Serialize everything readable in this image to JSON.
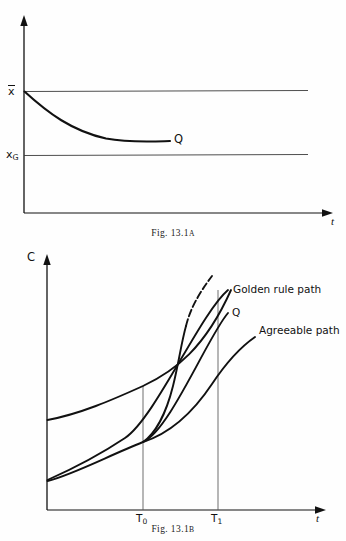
{
  "document": {
    "type": "textbook-figure-page",
    "figure_count": 2
  },
  "figure_a": {
    "caption_prefix": "Fig.",
    "caption_number": "13.1",
    "caption_suffix": "A",
    "caption_full": "Fig. 13.1A",
    "axes": {
      "x_label": "t",
      "y_label": "",
      "origin": {
        "x": 24,
        "y": 213
      },
      "x_axis_end": {
        "x": 332,
        "y": 213
      },
      "y_axis_top": {
        "x": 24,
        "y": 20
      }
    },
    "level_lines": [
      {
        "name": "x-bar-level",
        "label": "x̄",
        "label_plain": "x-bar",
        "y": 91,
        "x_start": 24,
        "x_end": 308
      },
      {
        "name": "x-golden-level",
        "label": "x_G",
        "label_plain": "xG",
        "y": 155,
        "x_start": 24,
        "x_end": 308
      }
    ],
    "curve": {
      "name": "decaying-path",
      "endpoint_label": "Q",
      "start": {
        "x": 24,
        "y": 91
      },
      "end": {
        "x": 170,
        "y": 141
      },
      "description": "monotonically decreasing convex curve asymptoting toward a level above x_G"
    }
  },
  "figure_b": {
    "caption_prefix": "Fig.",
    "caption_number": "13.1",
    "caption_suffix": "B",
    "caption_full": "Fig. 13.1B",
    "axes": {
      "x_label": "t",
      "y_label": "C",
      "origin": {
        "x": 47,
        "y": 510
      },
      "x_axis_end": {
        "x": 325,
        "y": 510
      },
      "y_axis_top": {
        "x": 47,
        "y": 258
      }
    },
    "x_ticks": [
      {
        "label": "T",
        "sub": "0",
        "label_plain": "T0",
        "x": 143
      },
      {
        "label": "T",
        "sub": "1",
        "label_plain": "T1",
        "x": 218
      }
    ],
    "curves": [
      {
        "name": "agreeable-path-upper",
        "label": "",
        "start": {
          "x": 47,
          "y": 420
        },
        "end": {
          "x": 230,
          "y": 290
        },
        "description": "upper convex rising curve starting high on the C axis"
      },
      {
        "name": "golden-rule-path",
        "label": "Golden rule path",
        "label_pos": {
          "x": 232,
          "y": 291
        },
        "start": {
          "x": 47,
          "y": 480
        },
        "end": {
          "x": 228,
          "y": 290
        },
        "description": "rising near-straight path labelled Golden rule path"
      },
      {
        "name": "optimal-path-q",
        "label": "Q",
        "label_pos": {
          "x": 233,
          "y": 314
        },
        "start": {
          "x": 47,
          "y": 481
        },
        "end": {
          "x": 228,
          "y": 313
        },
        "description": "lower rising path labelled Q, passing through T0 kink"
      },
      {
        "name": "agreeable-path-lower",
        "label": "Agreeable path",
        "label_pos": {
          "x": 258,
          "y": 331
        },
        "start": {
          "x": 143,
          "y": 442
        },
        "end": {
          "x": 255,
          "y": 337
        },
        "description": "rising convex curve labelled Agreeable path"
      },
      {
        "name": "turnpike-s-curve",
        "label": "",
        "start": {
          "x": 143,
          "y": 442
        },
        "end": {
          "x": 212,
          "y": 276
        },
        "description": "steep S-shaped (partly dashed) curve rising sharply after T0"
      }
    ],
    "vertical_guides": [
      {
        "name": "guide-T0",
        "x": 143,
        "y_top": 386,
        "y_bottom": 510
      },
      {
        "name": "guide-T1",
        "x": 218,
        "y_top": 290,
        "y_bottom": 510
      }
    ]
  },
  "colors": {
    "ink": "#111111",
    "thin_rule": "#555555",
    "page_background": "#fefefe"
  }
}
